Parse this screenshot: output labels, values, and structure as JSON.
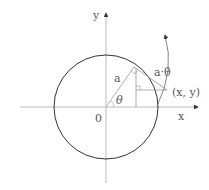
{
  "diagram": {
    "type": "involute-of-circle",
    "labels": {
      "y_axis": "y",
      "x_axis": "x",
      "origin": "0",
      "radius": "a",
      "angle": "θ",
      "arc_length": "a·θ",
      "point": "(x, y)"
    },
    "colors": {
      "axes": "#aaaaaa",
      "circle": "#333333",
      "lines": "#999999",
      "text": "#555555"
    }
  }
}
